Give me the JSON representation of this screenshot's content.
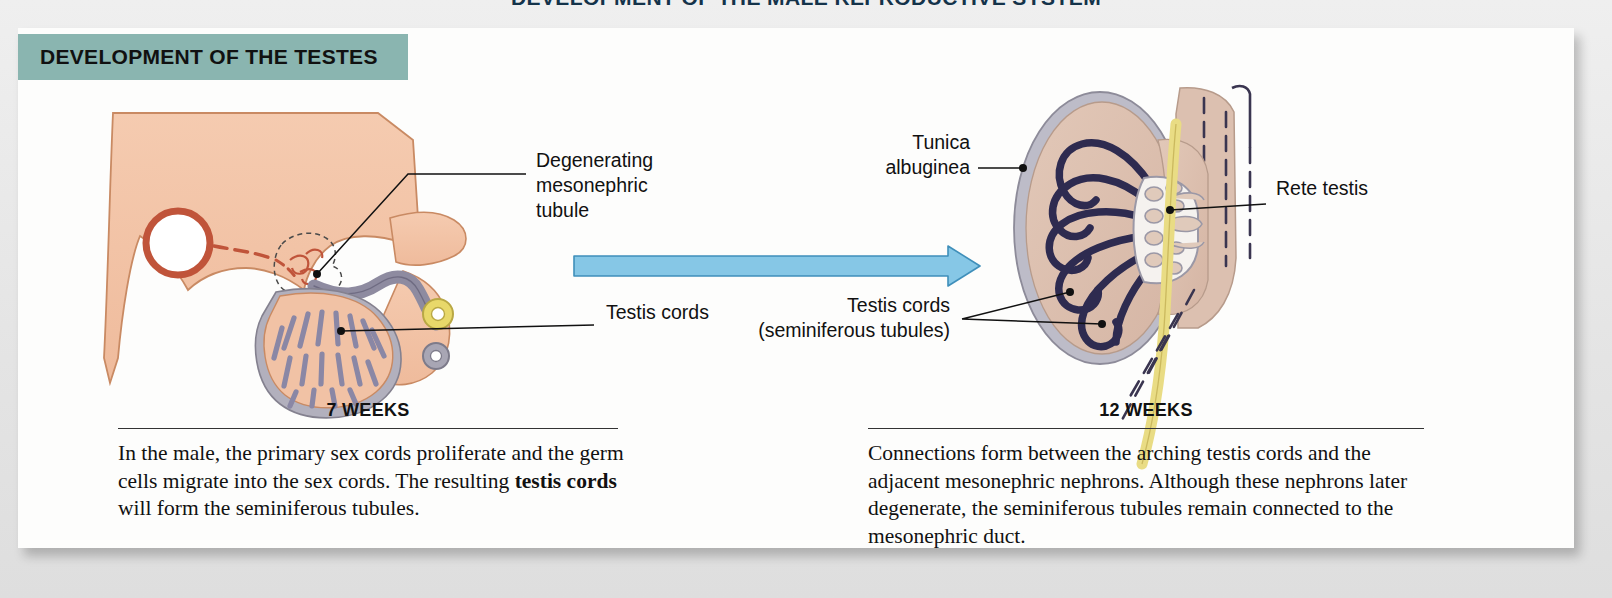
{
  "page": {
    "top_title": "DEVELOPMENT OF THE MALE REPRODUCTIVE SYSTEM",
    "banner_title": "DEVELOPMENT OF THE TESTES",
    "banner_color": "#8ab5b0",
    "card_bg": "#fdfdfc",
    "page_bg": "#e9e9e9"
  },
  "arrow": {
    "name": "progression-arrow",
    "fill": "#86c7e6",
    "stroke": "#3f8fba"
  },
  "left_panel": {
    "stage_label": "7 WEEKS",
    "caption_part1": "In the male, the primary sex cords proliferate and the germ cells migrate into the sex cords. The resulting ",
    "caption_bold": "testis cords",
    "caption_part2": " will form the seminiferous tubules.",
    "labels": [
      {
        "id": "degenerating-mesonephric-tubule",
        "text": "Degenerating\nmesonephric\ntubule"
      },
      {
        "id": "testis-cords",
        "text": "Testis cords"
      }
    ],
    "colors": {
      "body_fill": "#f2c3a6",
      "body_stroke": "#c98a63",
      "vessel_stroke": "#c0543a",
      "capsule": "#b2b0bd",
      "cords": "#8a87a5",
      "duct_yellow": "#e8d86a",
      "duct_gray": "#a8a6b4"
    }
  },
  "right_panel": {
    "stage_label": "12 WEEKS",
    "caption": "Connections form between the arching testis cords and the adjacent mesonephric nephrons. Although these nephrons later degenerate, the seminiferous tubules remain connected to the mesonephric duct.",
    "labels": [
      {
        "id": "tunica-albuginea",
        "text": "Tunica\nalbuginea"
      },
      {
        "id": "testis-cords-seminiferous",
        "text": "Testis cords\n(seminiferous tubules)"
      },
      {
        "id": "rete-testis",
        "text": "Rete testis"
      }
    ],
    "colors": {
      "parenchyma": "#dcc0b0",
      "tunica": "#bdbcc8",
      "cords": "#2e2b50",
      "rete_fill": "#f5f2ef",
      "duct_yellow": "#e9dc84",
      "dash_stroke": "#3a3550"
    }
  }
}
